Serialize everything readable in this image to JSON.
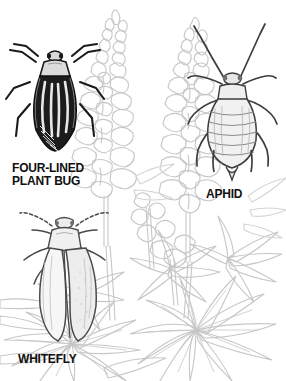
{
  "figure": {
    "kind": "natural-history-line-illustration",
    "background_color": "#ffffff",
    "plant": {
      "name": "lupine",
      "line_color": "#c6c6c6",
      "parts": [
        "flower-spike-left",
        "flower-spike-right",
        "palmate-leaves",
        "stems"
      ]
    },
    "ink_color": "#1a1a1a",
    "shade_color": "#8d8d8d"
  },
  "labels": {
    "four_lined_plant_bug": {
      "line1": "FOUR-LINED",
      "line2": "PLANT BUG"
    },
    "aphid": "APHID",
    "whitefly": "WHITEFLY"
  },
  "insects": [
    {
      "id": "four-lined-plant-bug",
      "common_name": "FOUR-LINED PLANT BUG",
      "position": "upper-left",
      "rendering": "dark solid ink with four longitudinal pale stripes on the wings",
      "features": [
        "two antennae",
        "six legs",
        "striped elytra",
        "pale pronotum"
      ]
    },
    {
      "id": "aphid",
      "common_name": "APHID",
      "position": "upper-right",
      "rendering": "pale stippled pear-shaped body with fine segment lines",
      "features": [
        "two long curved antennae",
        "six legs",
        "segmented abdomen",
        "cornicles"
      ]
    },
    {
      "id": "whitefly",
      "common_name": "WHITEFLY",
      "position": "lower-left",
      "rendering": "pale body with two large rounded overlapping wings",
      "features": [
        "two segmented antennae",
        "six legs",
        "two broad wings",
        "small head"
      ]
    }
  ]
}
